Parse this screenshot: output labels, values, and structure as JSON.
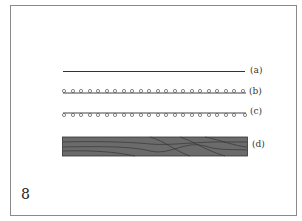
{
  "figure": {
    "number": "8",
    "items": [
      {
        "label": "(a)",
        "description": "plain straight line"
      },
      {
        "label": "(b)",
        "description": "line with small circles above"
      },
      {
        "label": "(c)",
        "description": "line with small circles below"
      },
      {
        "label": "(d)",
        "description": "dark gray bar with wavy grain lines"
      }
    ],
    "colors": {
      "border": "#8a8a8a",
      "line": "#333333",
      "bar_fill": "#6b6b6b",
      "bar_grain": "#2e2e2e"
    }
  }
}
